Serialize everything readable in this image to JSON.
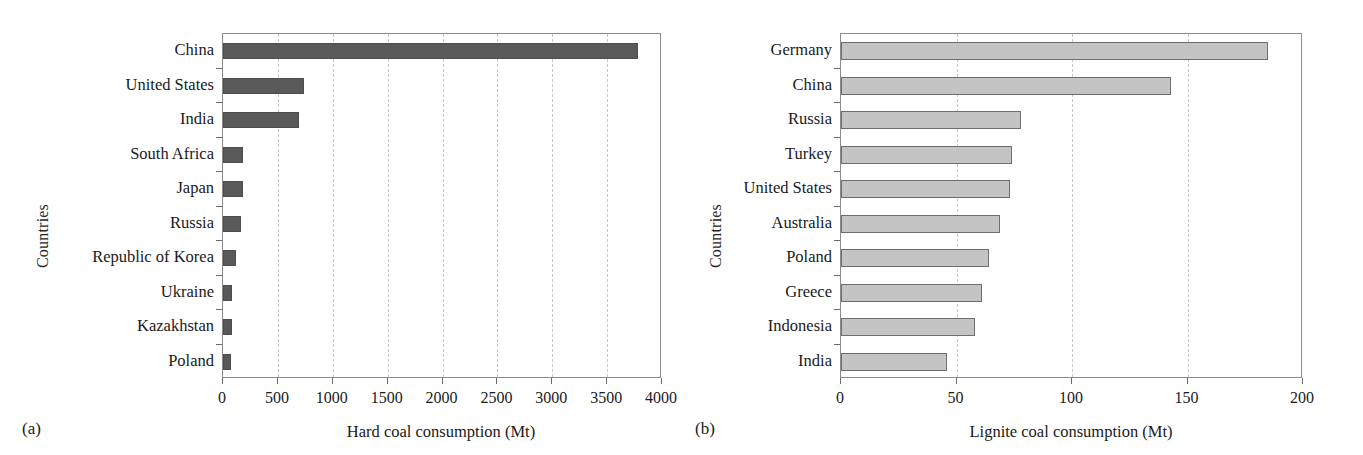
{
  "figure": {
    "background_color": "#ffffff",
    "panels": [
      {
        "letter": "(a)",
        "ylabel": "Countries",
        "xlabel": "Hard coal consumption (Mt)",
        "bar_color": "#595959",
        "bar_edge_color": "#4d4d4d"
      },
      {
        "letter": "(b)",
        "ylabel": "Countries",
        "xlabel": "Lignite coal consumption (Mt)",
        "bar_color": "#c4c4c4",
        "bar_edge_color": "#6e6e6e"
      }
    ]
  },
  "chart_data": [
    {
      "type": "bar",
      "orientation": "horizontal",
      "title": "",
      "xlabel": "Hard coal consumption (Mt)",
      "ylabel": "Countries",
      "xlim": [
        0,
        4000
      ],
      "xticks": [
        0,
        500,
        1000,
        1500,
        2000,
        2500,
        3000,
        3500,
        4000
      ],
      "xtick_labels": [
        "0",
        "500",
        "1000",
        "1500",
        "2000",
        "2500",
        "3000",
        "3500",
        "4000"
      ],
      "grid": "vertical-dashed",
      "legend": "none",
      "categories": [
        "China",
        "United States",
        "India",
        "South Africa",
        "Japan",
        "Russia",
        "Republic of Korea",
        "Ukraine",
        "Kazakhstan",
        "Poland"
      ],
      "values": [
        3780,
        742,
        696,
        185,
        180,
        165,
        120,
        82,
        78,
        72
      ]
    },
    {
      "type": "bar",
      "orientation": "horizontal",
      "title": "",
      "xlabel": "Lignite coal consumption (Mt)",
      "ylabel": "Countries",
      "xlim": [
        0,
        200
      ],
      "xticks": [
        0,
        50,
        100,
        150,
        200
      ],
      "xtick_labels": [
        "0",
        "50",
        "100",
        "150",
        "200"
      ],
      "grid": "vertical-dashed",
      "legend": "none",
      "categories": [
        "Germany",
        "China",
        "Russia",
        "Turkey",
        "United States",
        "Australia",
        "Poland",
        "Greece",
        "Indonesia",
        "India"
      ],
      "values": [
        185,
        143,
        78,
        74,
        73,
        69,
        64,
        61,
        58,
        46
      ]
    }
  ]
}
